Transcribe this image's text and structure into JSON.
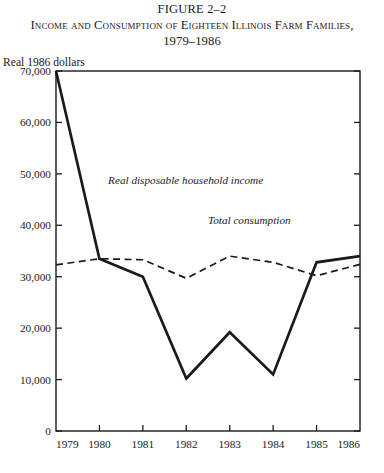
{
  "figure": {
    "number": "FIGURE 2–2",
    "title_line1": "Income and Consumption of Eighteen Illinois Farm Families,",
    "title_line2": "1979–1986",
    "y_unit_label": "Real 1986 dollars"
  },
  "chart_data": {
    "type": "line",
    "title": "Income and Consumption of Eighteen Illinois Farm Families, 1979–1986",
    "xlabel": "",
    "ylabel": "Real 1986 dollars",
    "x": [
      "1979",
      "1980",
      "1981",
      "1982",
      "1983",
      "1984",
      "1985",
      "1986"
    ],
    "xlim": [
      1979,
      1986
    ],
    "ylim": [
      0,
      70000
    ],
    "ytick_labels": [
      "0",
      "10,000",
      "20,000",
      "30,000",
      "40,000",
      "50,000",
      "60,000",
      "70,000"
    ],
    "ytick_values": [
      0,
      10000,
      20000,
      30000,
      40000,
      50000,
      60000,
      70000
    ],
    "xtick_labels": [
      "1979",
      "1980",
      "1981",
      "1982",
      "1983",
      "1984",
      "1985",
      "1986"
    ],
    "grid": false,
    "legend_position": "inline-annotations",
    "series": [
      {
        "name": "Real disposable household income",
        "style": "solid",
        "color": "#1a1a1a",
        "values": [
          70000,
          33500,
          30000,
          10200,
          19200,
          11000,
          32800,
          34000
        ]
      },
      {
        "name": "Total consumption",
        "style": "dashed",
        "color": "#1a1a1a",
        "values": [
          32300,
          33500,
          33300,
          29700,
          34000,
          32800,
          30200,
          32400
        ]
      }
    ],
    "annotations": [
      {
        "text": "Real disposable household income",
        "x": "1980.2",
        "y": 48000
      },
      {
        "text": "Total consumption",
        "x": "1982.5",
        "y": 40200
      }
    ]
  }
}
